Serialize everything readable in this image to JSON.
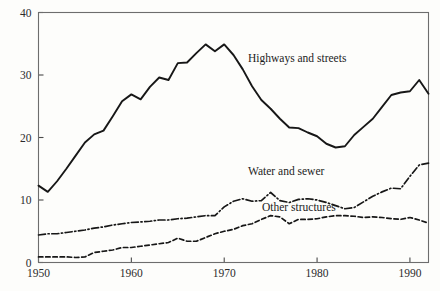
{
  "figure": {
    "background_color": "#fdfdfb",
    "ink_color": "#171717",
    "axis_color": "#6d6d6d"
  },
  "axis": {
    "y_ticks": [
      "0",
      "10",
      "20",
      "30",
      "40"
    ],
    "x_ticks": [
      "1950",
      "1960",
      "1970",
      "1980",
      "1990"
    ]
  },
  "labels": {
    "highways": "Highways and streets",
    "water": "Water and sewer",
    "other": "Other structures"
  },
  "chart_data": {
    "type": "line",
    "title": "",
    "xlabel": "",
    "ylabel": "",
    "xlim": [
      1950,
      1992
    ],
    "ylim": [
      0,
      40
    ],
    "grid": false,
    "legend": "inline-annotations",
    "x": [
      1950,
      1951,
      1952,
      1953,
      1954,
      1955,
      1956,
      1957,
      1958,
      1959,
      1960,
      1961,
      1962,
      1963,
      1964,
      1965,
      1966,
      1967,
      1968,
      1969,
      1970,
      1971,
      1972,
      1973,
      1974,
      1975,
      1976,
      1977,
      1978,
      1979,
      1980,
      1981,
      1982,
      1983,
      1984,
      1985,
      1986,
      1987,
      1988,
      1989,
      1990,
      1991,
      1992
    ],
    "series": [
      {
        "name": "Highways and streets",
        "style": "solid",
        "values": [
          12.3,
          11.3,
          13.0,
          15.0,
          17.1,
          19.2,
          20.5,
          21.1,
          23.4,
          25.8,
          26.9,
          26.1,
          28.1,
          29.6,
          29.2,
          31.9,
          32.0,
          33.5,
          34.9,
          33.8,
          34.9,
          33.2,
          30.9,
          28.2,
          26.0,
          24.6,
          23.0,
          21.6,
          21.5,
          20.8,
          20.2,
          19.0,
          18.4,
          18.6,
          20.4,
          21.7,
          23.0,
          24.9,
          26.8,
          27.2,
          27.4,
          29.2,
          27.0
        ]
      },
      {
        "name": "Water and sewer",
        "style": "dash-dot",
        "values": [
          4.4,
          4.6,
          4.6,
          4.8,
          5.0,
          5.2,
          5.5,
          5.7,
          6.0,
          6.2,
          6.4,
          6.5,
          6.6,
          6.8,
          6.8,
          7.0,
          7.1,
          7.3,
          7.5,
          7.5,
          8.9,
          9.8,
          10.2,
          9.8,
          9.9,
          11.2,
          9.9,
          9.6,
          10.1,
          10.2,
          10.0,
          9.6,
          9.1,
          8.6,
          8.8,
          9.7,
          10.6,
          11.3,
          11.9,
          11.8,
          13.8,
          15.6,
          15.9
        ]
      },
      {
        "name": "Other structures",
        "style": "dashed",
        "values": [
          0.9,
          0.9,
          0.9,
          0.9,
          0.8,
          0.9,
          1.6,
          1.8,
          2.0,
          2.4,
          2.4,
          2.6,
          2.8,
          3.0,
          3.2,
          3.9,
          3.4,
          3.4,
          4.0,
          4.6,
          5.0,
          5.3,
          5.9,
          6.2,
          6.9,
          7.5,
          7.3,
          6.2,
          6.9,
          6.9,
          7.0,
          7.3,
          7.5,
          7.5,
          7.4,
          7.2,
          7.3,
          7.2,
          7.0,
          6.9,
          7.2,
          6.8,
          6.3
        ]
      }
    ]
  }
}
